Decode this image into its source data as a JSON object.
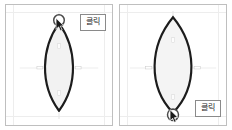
{
  "page": {
    "background": "#ffffff",
    "panel_border_color": "#bfbfbf",
    "guide_color": "#ededed"
  },
  "panels": [
    {
      "id": "left",
      "name": "shape-panel-left",
      "shape": {
        "name": "lens-shape-narrow",
        "description": "vertical pointed oval (lens/leaf) outline",
        "stroke_color": "#1c1c1c",
        "fill_color": "#f2f2f2",
        "stroke_width": 1.6,
        "width_px": 28,
        "height_px": 88
      },
      "handle": {
        "name": "drag-handle-top",
        "position": "top",
        "radius_px": 5,
        "stroke_color": "#4a4a4a",
        "fill_color": "#ffffff"
      },
      "cursor": {
        "name": "mouse-cursor-arrow",
        "position": "top"
      },
      "label": {
        "text": "클릭",
        "position": "top-right",
        "border_color": "#8a8a8a",
        "background": "#ffffff",
        "text_color": "#1a1a1a"
      },
      "midline_handles": 4
    },
    {
      "id": "right",
      "name": "shape-panel-right",
      "shape": {
        "name": "lens-shape-wide",
        "description": "vertical pointed oval (lens/leaf) outline, wider waist with sharp apexes",
        "stroke_color": "#1c1c1c",
        "fill_color": "#f4f4f4",
        "stroke_width": 1.6,
        "width_px": 38,
        "height_px": 88
      },
      "handle": {
        "name": "drag-handle-bottom",
        "position": "bottom",
        "radius_px": 5,
        "stroke_color": "#4a4a4a",
        "fill_color": "#ffffff"
      },
      "cursor": {
        "name": "mouse-cursor-arrow",
        "position": "bottom"
      },
      "label": {
        "text": "클릭",
        "position": "bottom-right",
        "border_color": "#8a8a8a",
        "background": "#ffffff",
        "text_color": "#1a1a1a"
      },
      "midline_handles": 4
    }
  ]
}
